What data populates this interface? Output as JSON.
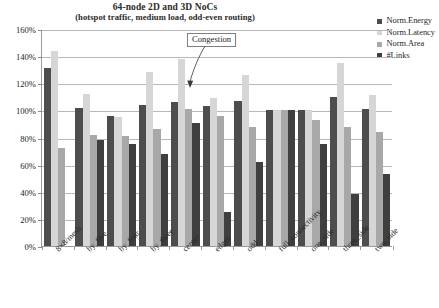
{
  "chart_data": {
    "type": "bar",
    "title": "64-node 2D and 3D NoCs",
    "subtitle": "(hotspot traffic, medium load, odd-even routing)",
    "xlabel": "",
    "ylabel": "",
    "ylim": [
      0,
      160
    ],
    "ytick_labels": [
      "0%",
      "20%",
      "40%",
      "60%",
      "80%",
      "100%",
      "120%",
      "140%",
      "160%"
    ],
    "ytick_values": [
      0,
      20,
      40,
      60,
      80,
      100,
      120,
      140,
      160
    ],
    "grid": true,
    "legend_position": "top-right",
    "categories": [
      "8×8/mesh",
      "by_five",
      "by_four",
      "by_three",
      "center",
      "edges",
      "odd",
      "full_connectivity",
      "one_side",
      "three_side",
      "two_side"
    ],
    "series": [
      {
        "name": "Norm.Energy",
        "color": "#4d4d4d",
        "values": [
          131,
          102,
          96,
          104,
          106,
          103,
          107,
          100,
          100,
          110,
          101
        ]
      },
      {
        "name": "Norm.Latency",
        "color": "#d6d6d6",
        "values": [
          144,
          112,
          95,
          128,
          138,
          109,
          126,
          100,
          100,
          135,
          111
        ]
      },
      {
        "name": "Norm.Area",
        "color": "#a8a8a8",
        "values": [
          72,
          82,
          81,
          86,
          101,
          96,
          88,
          100,
          93,
          88,
          84
        ]
      },
      {
        "name": "#Links",
        "color": "#3f3f3f",
        "values": [
          null,
          78,
          75,
          68,
          91,
          25,
          62,
          100,
          75,
          38,
          53
        ]
      }
    ],
    "annotations": [
      {
        "text": "Congestion",
        "target_category": "by_three",
        "target_series": "Norm.Latency"
      }
    ]
  },
  "legend": {
    "items": [
      {
        "label": "Norm.Energy",
        "color": "#4d4d4d"
      },
      {
        "label": "Norm.Latency",
        "color": "#d6d6d6"
      },
      {
        "label": "Norm.Area",
        "color": "#a8a8a8"
      },
      {
        "label": "#Links",
        "color": "#3f3f3f"
      }
    ]
  }
}
